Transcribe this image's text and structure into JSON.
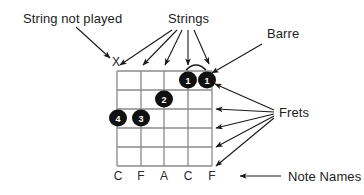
{
  "figure": {
    "background_color": "#ffffff",
    "ink_color": "#1a1a1a",
    "grid_color": "#808080",
    "dot_color": "#111111"
  },
  "labels": {
    "string_not_played": "String not played",
    "strings": "Strings",
    "barre": "Barre",
    "frets": "Frets",
    "note_names": "Note Names"
  },
  "fretboard": {
    "string_count": 5,
    "fret_count": 5,
    "muted_marker": "X",
    "note_names": [
      "C",
      "F",
      "A",
      "C",
      "F"
    ],
    "fingerings": [
      {
        "finger": "1",
        "string": 4,
        "fret": 1
      },
      {
        "finger": "1",
        "string": 5,
        "fret": 1
      },
      {
        "finger": "2",
        "string": 3,
        "fret": 2
      },
      {
        "finger": "3",
        "string": 2,
        "fret": 3
      },
      {
        "finger": "4",
        "string": 1,
        "fret": 3
      }
    ],
    "barre": {
      "from_string": 4,
      "to_string": 5,
      "fret": 1
    }
  },
  "callouts": [
    {
      "name": "string-not-played",
      "target": "muted-string-x",
      "arrow_count": 1
    },
    {
      "name": "strings",
      "target": "string-lines",
      "arrow_count": 5
    },
    {
      "name": "barre",
      "target": "barre-arc",
      "arrow_count": 1
    },
    {
      "name": "frets",
      "target": "fret-lines",
      "arrow_count": 5
    },
    {
      "name": "note-names",
      "target": "note-letters-row",
      "arrow_count": 1
    }
  ]
}
